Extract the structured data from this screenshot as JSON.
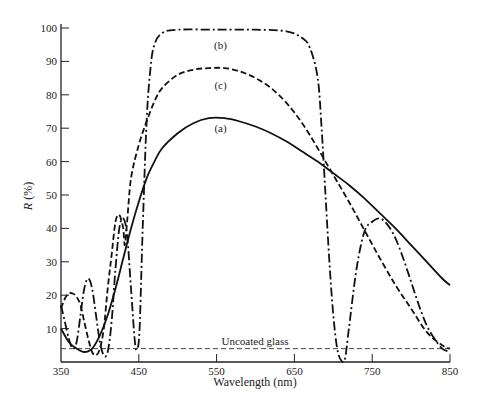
{
  "chart_data": {
    "type": "line",
    "title": "",
    "xlabel": "Wavelength (nm)",
    "ylabel": "R (%)",
    "xlim": [
      350,
      850
    ],
    "ylim": [
      0,
      100
    ],
    "x_ticks": [
      350,
      450,
      550,
      650,
      750,
      850
    ],
    "y_ticks": [
      10,
      20,
      30,
      40,
      50,
      60,
      70,
      80,
      90,
      100
    ],
    "grid": false,
    "legend": "inline labels",
    "series": [
      {
        "name": "(a)",
        "style": "solid",
        "label_pos": [
          555,
          70
        ],
        "points": [
          [
            350,
            10
          ],
          [
            360,
            6
          ],
          [
            370,
            4
          ],
          [
            380,
            3
          ],
          [
            390,
            4
          ],
          [
            400,
            8
          ],
          [
            410,
            14
          ],
          [
            420,
            22
          ],
          [
            430,
            31
          ],
          [
            440,
            40
          ],
          [
            450,
            48
          ],
          [
            460,
            55
          ],
          [
            470,
            60
          ],
          [
            480,
            64
          ],
          [
            500,
            68.5
          ],
          [
            520,
            71.5
          ],
          [
            540,
            73
          ],
          [
            560,
            73
          ],
          [
            580,
            72
          ],
          [
            600,
            70.5
          ],
          [
            620,
            68.5
          ],
          [
            640,
            66
          ],
          [
            660,
            63
          ],
          [
            680,
            60
          ],
          [
            700,
            56.5
          ],
          [
            720,
            53
          ],
          [
            740,
            49
          ],
          [
            760,
            44.5
          ],
          [
            780,
            40
          ],
          [
            800,
            35
          ],
          [
            820,
            30
          ],
          [
            840,
            25
          ],
          [
            850,
            23
          ]
        ]
      },
      {
        "name": "(b)",
        "style": "dash-dot",
        "label_pos": [
          555,
          95
        ],
        "points": [
          [
            350,
            17
          ],
          [
            355,
            12
          ],
          [
            360,
            7
          ],
          [
            365,
            4
          ],
          [
            370,
            6
          ],
          [
            375,
            14
          ],
          [
            380,
            22
          ],
          [
            385,
            25
          ],
          [
            390,
            22
          ],
          [
            395,
            14
          ],
          [
            400,
            6
          ],
          [
            405,
            2
          ],
          [
            410,
            3
          ],
          [
            415,
            12
          ],
          [
            420,
            28
          ],
          [
            425,
            40
          ],
          [
            430,
            43
          ],
          [
            435,
            38
          ],
          [
            440,
            22
          ],
          [
            445,
            6
          ],
          [
            448,
            4
          ],
          [
            451,
            10
          ],
          [
            455,
            40
          ],
          [
            460,
            72
          ],
          [
            465,
            88
          ],
          [
            470,
            95
          ],
          [
            480,
            98.5
          ],
          [
            500,
            99.5
          ],
          [
            550,
            99.5
          ],
          [
            600,
            99.5
          ],
          [
            640,
            99
          ],
          [
            660,
            97
          ],
          [
            670,
            94
          ],
          [
            680,
            85
          ],
          [
            685,
            70
          ],
          [
            690,
            50
          ],
          [
            695,
            30
          ],
          [
            700,
            14
          ],
          [
            705,
            4
          ],
          [
            710,
            0.5
          ],
          [
            715,
            1
          ],
          [
            720,
            10
          ],
          [
            730,
            28
          ],
          [
            740,
            39
          ],
          [
            750,
            42
          ],
          [
            760,
            43
          ],
          [
            770,
            41
          ],
          [
            780,
            37
          ],
          [
            790,
            31
          ],
          [
            800,
            24
          ],
          [
            810,
            17
          ],
          [
            820,
            11
          ],
          [
            830,
            7
          ],
          [
            840,
            4
          ],
          [
            850,
            3
          ]
        ]
      },
      {
        "name": "(c)",
        "style": "dashed",
        "label_pos": [
          555,
          83
        ],
        "points": [
          [
            350,
            16
          ],
          [
            355,
            19
          ],
          [
            360,
            20.5
          ],
          [
            365,
            20.5
          ],
          [
            370,
            19.5
          ],
          [
            375,
            17
          ],
          [
            380,
            12
          ],
          [
            385,
            7
          ],
          [
            390,
            3
          ],
          [
            395,
            2
          ],
          [
            400,
            4
          ],
          [
            405,
            10
          ],
          [
            410,
            22
          ],
          [
            415,
            32
          ],
          [
            420,
            42
          ],
          [
            425,
            44
          ],
          [
            430,
            40
          ],
          [
            432,
            35
          ],
          [
            435,
            42
          ],
          [
            440,
            55
          ],
          [
            450,
            65
          ],
          [
            460,
            72
          ],
          [
            470,
            78
          ],
          [
            480,
            82
          ],
          [
            500,
            86
          ],
          [
            520,
            87.5
          ],
          [
            540,
            88
          ],
          [
            560,
            88
          ],
          [
            580,
            87
          ],
          [
            600,
            85
          ],
          [
            620,
            82
          ],
          [
            640,
            77.5
          ],
          [
            660,
            71.5
          ],
          [
            680,
            64
          ],
          [
            700,
            56
          ],
          [
            720,
            48
          ],
          [
            740,
            39.5
          ],
          [
            760,
            31
          ],
          [
            780,
            23
          ],
          [
            800,
            16
          ],
          [
            820,
            9
          ],
          [
            840,
            5
          ],
          [
            850,
            4
          ]
        ]
      }
    ],
    "reference_line": {
      "label": "Uncoated glass",
      "y": 4,
      "style": "dashed"
    }
  }
}
